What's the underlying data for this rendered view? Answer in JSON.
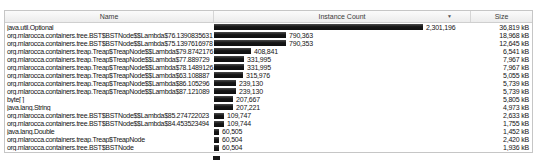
{
  "table": {
    "columns": [
      {
        "label": "Name"
      },
      {
        "label": "Instance Count"
      },
      {
        "label": "Size"
      }
    ],
    "sort": {
      "column": "Instance Count",
      "direction": "descending",
      "icon": "▼"
    },
    "bar_color": "#1c1c1c",
    "rows": [
      {
        "name": "java.util.Optional",
        "instance_count": "2,301,196",
        "size": "36,819 kB"
      },
      {
        "name": "org.mlarocca.containers.tree.BST$BSTNode$$Lambda$76.1390835631",
        "instance_count": "790,363",
        "size": "18,968 kB"
      },
      {
        "name": "org.mlarocca.containers.tree.BST$BSTNode$$Lambda$75.1397616978",
        "instance_count": "790,353",
        "size": "12,645 kB"
      },
      {
        "name": "org.mlarocca.containers.treap.Treap$TreapNode$$Lambda$79.8742176",
        "instance_count": "408,841",
        "size": "6,541 kB"
      },
      {
        "name": "org.mlarocca.containers.treap.Treap$TreapNode$$Lambda$77.889729",
        "instance_count": "331,995",
        "size": "7,967 kB"
      },
      {
        "name": "org.mlarocca.containers.treap.Treap$TreapNode$$Lambda$78.1489126",
        "instance_count": "331,995",
        "size": "7,967 kB"
      },
      {
        "name": "org.mlarocca.containers.treap.Treap$TreapNode$$Lambda$63.108887",
        "instance_count": "315,976",
        "size": "5,055 kB"
      },
      {
        "name": "org.mlarocca.containers.treap.Treap$TreapNode$$Lambda$86.105296",
        "instance_count": "239,130",
        "size": "5,739 kB"
      },
      {
        "name": "org.mlarocca.containers.treap.Treap$TreapNode$$Lambda$87.121089",
        "instance_count": "239,130",
        "size": "5,739 kB"
      },
      {
        "name": "byte[ ]",
        "instance_count": "207,667",
        "size": "5,805 kB"
      },
      {
        "name": "java.lang.String",
        "instance_count": "207,221",
        "size": "4,973 kB"
      },
      {
        "name": "org.mlarocca.containers.tree.BST$BSTNode$$Lambda$85.274722023",
        "instance_count": "109,747",
        "size": "2,633 kB"
      },
      {
        "name": "org.mlarocca.containers.tree.BST$BSTNode$$Lambda$84.453523494",
        "instance_count": "109,744",
        "size": "1,755 kB"
      },
      {
        "name": "java.lang.Double",
        "instance_count": "60,505",
        "size": "1,452 kB"
      },
      {
        "name": "org.mlarocca.containers.treap.Treap$TreapNode",
        "instance_count": "60,504",
        "size": "2,420 kB"
      },
      {
        "name": "org.mlarocca.containers.tree.BST$BSTNode",
        "instance_count": "60,504",
        "size": "1,936 kB"
      }
    ]
  }
}
